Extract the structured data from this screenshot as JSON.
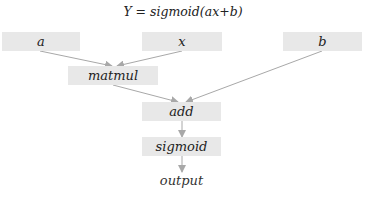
{
  "title": "Y = sigmoid(ax+b)",
  "nodes": {
    "a": "a",
    "x": "x",
    "b": "b",
    "matmul": "matmul",
    "add": "add",
    "sigmoid": "sigmoid",
    "output": "output"
  },
  "edges": [
    [
      "a",
      "matmul"
    ],
    [
      "x",
      "matmul"
    ],
    [
      "matmul",
      "add"
    ],
    [
      "b",
      "add"
    ],
    [
      "add",
      "sigmoid"
    ],
    [
      "sigmoid",
      "output"
    ]
  ],
  "colors": {
    "node_fill": "#e8e8e8",
    "edge": "#a8a8a8"
  }
}
